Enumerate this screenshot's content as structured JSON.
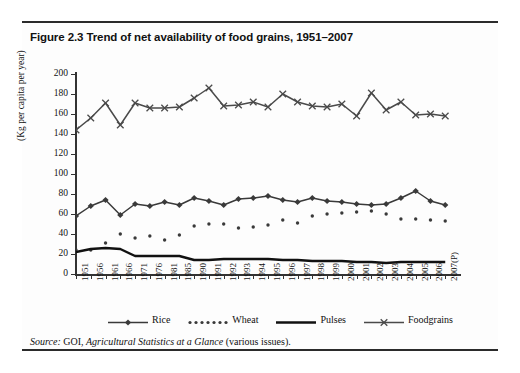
{
  "figure": {
    "title": "Figure 2.3 Trend of net availability of food grains, 1951–2007",
    "source_label": "Source:",
    "source_agency": "GOI,",
    "source_publication": "Agricultural Statistics at a Glance",
    "source_suffix": "(various issues)."
  },
  "chart_data": {
    "type": "line",
    "title": "Figure 2.3 Trend of net availability of food grains, 1951–2007",
    "xlabel": "",
    "ylabel": "(Kg per capita per year)",
    "ylim": [
      0,
      200
    ],
    "yticks": [
      0,
      20,
      40,
      60,
      80,
      100,
      120,
      140,
      160,
      180,
      200
    ],
    "grid": false,
    "legend_position": "bottom",
    "categories": [
      "1951",
      "1956",
      "1961",
      "1966",
      "1971",
      "1976",
      "1981",
      "1985",
      "1990",
      "1991",
      "1992",
      "1993",
      "1994",
      "1995",
      "1996",
      "1997",
      "1998",
      "1999",
      "2000",
      "2001",
      "2002",
      "2003",
      "2004",
      "2005",
      "2006",
      "2007(P)"
    ],
    "series": [
      {
        "name": "Rice",
        "marker": "diamond",
        "color": "#3a3a3a",
        "values": [
          58,
          68,
          74,
          59,
          70,
          68,
          72,
          69,
          76,
          73,
          69,
          75,
          76,
          78,
          74,
          72,
          76,
          73,
          72,
          70,
          69,
          70,
          76,
          83,
          73,
          69
        ]
      },
      {
        "name": "Wheat",
        "marker": "dotted",
        "color": "#3a3a3a",
        "values": [
          24,
          24,
          31,
          40,
          36,
          38,
          34,
          39,
          48,
          50,
          50,
          46,
          47,
          49,
          54,
          51,
          58,
          60,
          61,
          62,
          63,
          60,
          55,
          55,
          54,
          53
        ]
      },
      {
        "name": "Pulses",
        "marker": "none",
        "color": "#111111",
        "values": [
          22,
          25,
          26,
          25,
          18,
          18,
          18,
          18,
          14,
          14,
          15,
          15,
          15,
          15,
          14,
          14,
          13,
          13,
          13,
          12,
          12,
          11,
          12,
          12,
          12,
          12
        ]
      },
      {
        "name": "Foodgrains",
        "marker": "cross",
        "color": "#4a4a4a",
        "values": [
          144,
          156,
          171,
          149,
          171,
          166,
          166,
          167,
          176,
          186,
          168,
          169,
          172,
          167,
          180,
          172,
          168,
          167,
          170,
          158,
          181,
          164,
          172,
          159,
          160,
          158
        ]
      }
    ],
    "legend": [
      "Rice",
      "Wheat",
      "Pulses",
      "Foodgrains"
    ]
  }
}
